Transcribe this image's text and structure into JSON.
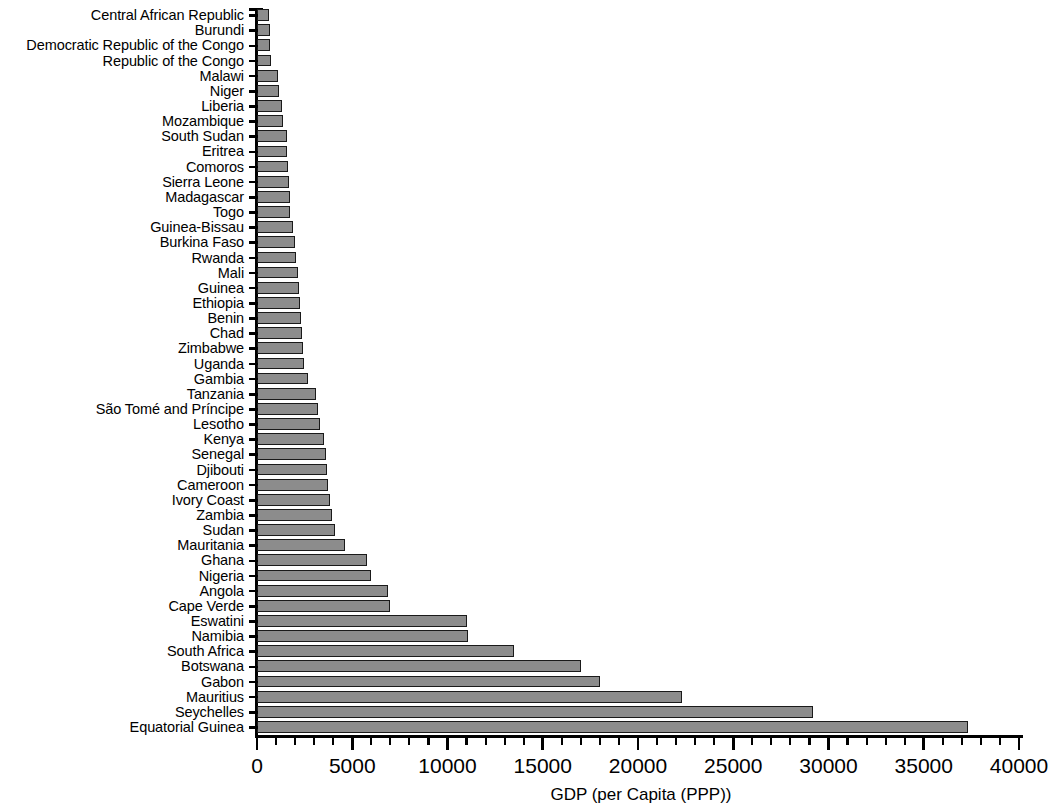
{
  "chart_data": {
    "type": "bar",
    "orientation": "horizontal",
    "title": "",
    "subtitle": "",
    "xlabel": "GDP (per Capita (PPP))",
    "ylabel": "",
    "xlim": [
      0,
      40000
    ],
    "xticks": [
      0,
      5000,
      10000,
      15000,
      20000,
      25000,
      30000,
      35000,
      40000
    ],
    "xticklabels": [
      "0",
      "5000",
      "10000",
      "15000",
      "20000",
      "25000",
      "30000",
      "35000",
      "40000"
    ],
    "minor_tick_interval": 1000,
    "grid": false,
    "legend": null,
    "bar_fill_color": "#8c8c8c",
    "bar_edge_color": "#1a1a1a",
    "categories": [
      "Central African Republic",
      "Burundi",
      "Democratic Republic of the Congo",
      "Republic of the Congo",
      "Malawi",
      "Niger",
      "Liberia",
      "Mozambique",
      "South Sudan",
      "Eritrea",
      "Comoros",
      "Sierra Leone",
      "Madagascar",
      "Togo",
      "Guinea-Bissau",
      "Burkina Faso",
      "Rwanda",
      "Mali",
      "Guinea",
      "Ethiopia",
      "Benin",
      "Chad",
      "Zimbabwe",
      "Uganda",
      "Gambia",
      "Tanzania",
      "São Tomé and Príncipe",
      "Lesotho",
      "Kenya",
      "Senegal",
      "Djibouti",
      "Cameroon",
      "Ivory Coast",
      "Zambia",
      "Sudan",
      "Mauritania",
      "Ghana",
      "Nigeria",
      "Angola",
      "Cape Verde",
      "Eswatini",
      "Namibia",
      "South Africa",
      "Botswana",
      "Gabon",
      "Mauritius",
      "Seychelles",
      "Equatorial Guinea"
    ],
    "values": [
      640,
      660,
      700,
      760,
      1100,
      1150,
      1300,
      1350,
      1550,
      1600,
      1650,
      1700,
      1720,
      1750,
      1900,
      2000,
      2050,
      2150,
      2200,
      2250,
      2300,
      2350,
      2400,
      2450,
      2700,
      3100,
      3200,
      3300,
      3500,
      3600,
      3650,
      3750,
      3850,
      3950,
      4100,
      4600,
      5800,
      6000,
      6900,
      7000,
      11000,
      11100,
      13500,
      17000,
      18000,
      22300,
      29200,
      37300
    ]
  }
}
